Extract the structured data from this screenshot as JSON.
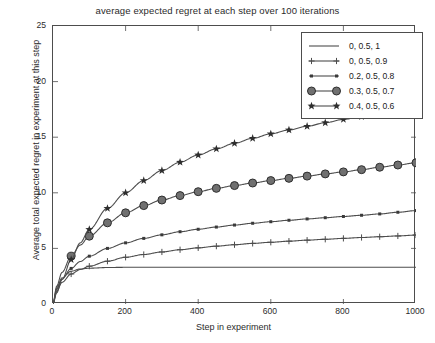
{
  "chart_data": {
    "type": "line",
    "title": "average expected regret at each step over 100 iterations",
    "xlabel": "Step in experiment",
    "ylabel": "Average total expected regret in experiment at this step",
    "xlim": [
      0,
      1000
    ],
    "ylim": [
      0,
      25
    ],
    "xticks": [
      0,
      200,
      400,
      600,
      800,
      1000
    ],
    "yticks": [
      0,
      5,
      10,
      15,
      20,
      25
    ],
    "grid": false,
    "legend_position": "top-right",
    "x": [
      0,
      10,
      25,
      50,
      75,
      100,
      150,
      200,
      250,
      300,
      350,
      400,
      450,
      500,
      550,
      600,
      650,
      700,
      750,
      800,
      850,
      900,
      950,
      1000
    ],
    "series": [
      {
        "name": "0, 0.5, 1",
        "marker": "none",
        "color": "#4d4d4d",
        "values": [
          0,
          1.45,
          2.35,
          2.95,
          3.15,
          3.22,
          3.28,
          3.3,
          3.3,
          3.3,
          3.3,
          3.3,
          3.3,
          3.3,
          3.3,
          3.3,
          3.3,
          3.3,
          3.3,
          3.3,
          3.3,
          3.3,
          3.3,
          3.3
        ]
      },
      {
        "name": "0, 0.5, 0.9",
        "marker": "plus",
        "color": "#4d4d4d",
        "values": [
          0,
          1.15,
          1.95,
          2.7,
          3.1,
          3.4,
          3.85,
          4.2,
          4.45,
          4.68,
          4.88,
          5.05,
          5.2,
          5.33,
          5.45,
          5.55,
          5.65,
          5.74,
          5.82,
          5.9,
          5.98,
          6.05,
          6.12,
          6.2
        ]
      },
      {
        "name": "0.2, 0.5, 0.8",
        "marker": "dot",
        "color": "#4d4d4d",
        "values": [
          0,
          1.3,
          2.25,
          3.2,
          3.82,
          4.3,
          5.0,
          5.5,
          5.9,
          6.22,
          6.5,
          6.72,
          6.92,
          7.1,
          7.26,
          7.4,
          7.53,
          7.65,
          7.76,
          7.87,
          7.98,
          8.1,
          8.25,
          8.4
        ]
      },
      {
        "name": "0.3, 0.5, 0.7",
        "marker": "circle",
        "color": "#4d4d4d",
        "values": [
          0,
          1.6,
          2.85,
          4.3,
          5.3,
          6.1,
          7.3,
          8.2,
          8.85,
          9.35,
          9.75,
          10.1,
          10.4,
          10.65,
          10.88,
          11.1,
          11.3,
          11.5,
          11.7,
          11.88,
          12.08,
          12.3,
          12.5,
          12.7
        ]
      },
      {
        "name": "0.4, 0.5, 0.6",
        "marker": "star",
        "color": "#4d4d4d",
        "values": [
          0,
          1.0,
          2.2,
          4.0,
          5.5,
          6.7,
          8.6,
          10.0,
          11.1,
          12.0,
          12.75,
          13.4,
          13.95,
          14.45,
          14.9,
          15.3,
          15.65,
          15.98,
          16.3,
          16.6,
          16.85,
          17.1,
          17.3,
          17.5
        ]
      }
    ]
  },
  "legend": {
    "entries": [
      {
        "label": "0, 0.5, 1"
      },
      {
        "label": "0, 0.5, 0.9"
      },
      {
        "label": "0.2, 0.5, 0.8"
      },
      {
        "label": "0.3, 0.5, 0.7"
      },
      {
        "label": "0.4, 0.5, 0.6"
      }
    ]
  },
  "axis": {
    "y_labels": [
      "25",
      "20",
      "15",
      "10",
      "5",
      "0"
    ],
    "x_labels": [
      "0",
      "200",
      "400",
      "600",
      "800",
      "1000"
    ]
  }
}
